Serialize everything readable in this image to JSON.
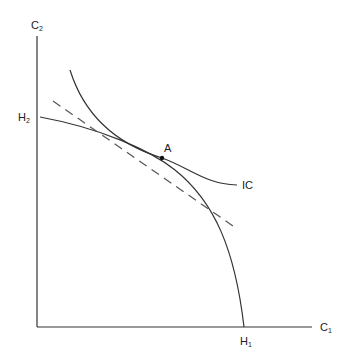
{
  "diagram": {
    "axes": {
      "y_label": "C",
      "y_label_sub": "2",
      "x_label": "C",
      "x_label_sub": "1"
    },
    "curves": {
      "production_frontier": {
        "start_label": "H",
        "start_label_sub": "2",
        "end_label": "H",
        "end_label_sub": "1"
      },
      "indifference_curve": {
        "label": "IC"
      },
      "tangent_line": {
        "style": "dashed"
      }
    },
    "point": {
      "label": "A"
    },
    "colors": {
      "line": "#333333",
      "background": "#ffffff"
    }
  }
}
